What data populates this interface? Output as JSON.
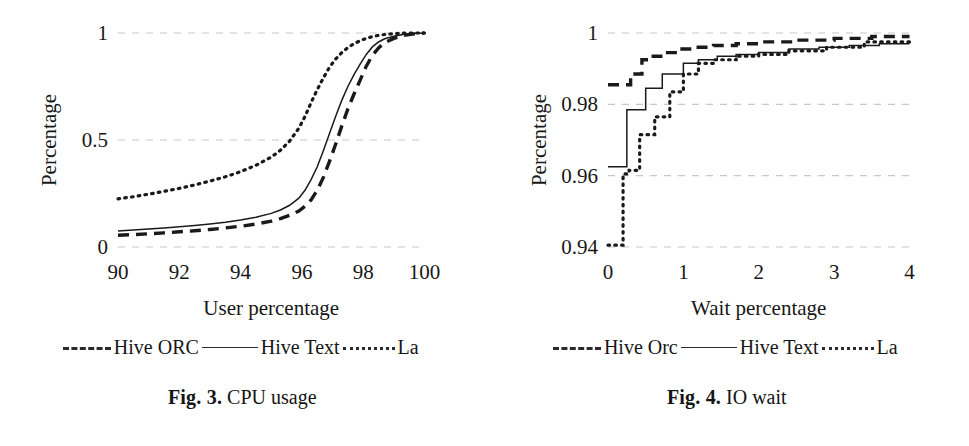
{
  "document": {
    "type": "paper-figure-pair",
    "background_color": "#ffffff",
    "ink_color": "#1a1a1a",
    "grid_color": "#c8c8c8"
  },
  "figures": [
    {
      "id": "fig3",
      "caption_number": "Fig. 3.",
      "caption_text": "CPU usage",
      "legend": [
        {
          "label": "Hive ORC",
          "style": "dashed"
        },
        {
          "label": "Hive Text",
          "style": "solid"
        },
        {
          "label": "La",
          "style": "dotted"
        }
      ],
      "chart_data": {
        "type": "line",
        "title": "",
        "subtitle": "",
        "xlabel": "User percentage",
        "ylabel": "Percentage",
        "xlim": [
          90,
          100
        ],
        "ylim": [
          0,
          1
        ],
        "xticks": [
          90,
          92,
          94,
          96,
          98,
          100
        ],
        "xticklabels": [
          "90",
          "92",
          "94",
          "96",
          "98",
          "100"
        ],
        "yticks": [
          0,
          0.5,
          1
        ],
        "yticklabels": [
          "0",
          "0.5",
          "1"
        ],
        "grid": true,
        "grid_axis": "y",
        "legend_position": "below-plot",
        "annotations": [],
        "series": [
          {
            "name": "Hive ORC",
            "style": "dashed",
            "x": [
              90.0,
              90.5,
              91.0,
              91.5,
              92.0,
              92.5,
              93.0,
              93.5,
              94.0,
              94.5,
              95.0,
              95.3,
              95.6,
              95.9,
              96.1,
              96.3,
              96.5,
              96.7,
              96.9,
              97.1,
              97.3,
              97.5,
              97.7,
              97.9,
              98.1,
              98.3,
              98.5,
              98.7,
              99.0,
              99.3,
              99.6,
              100.0
            ],
            "y": [
              0.055,
              0.058,
              0.062,
              0.066,
              0.071,
              0.076,
              0.082,
              0.089,
              0.097,
              0.107,
              0.121,
              0.133,
              0.148,
              0.168,
              0.19,
              0.22,
              0.265,
              0.325,
              0.4,
              0.48,
              0.565,
              0.645,
              0.715,
              0.78,
              0.845,
              0.895,
              0.93,
              0.955,
              0.975,
              0.988,
              0.995,
              1.0
            ]
          },
          {
            "name": "Hive Text",
            "style": "solid",
            "x": [
              90.0,
              90.5,
              91.0,
              91.5,
              92.0,
              92.5,
              93.0,
              93.5,
              94.0,
              94.5,
              95.0,
              95.3,
              95.6,
              95.9,
              96.1,
              96.3,
              96.5,
              96.7,
              96.9,
              97.1,
              97.3,
              97.5,
              97.7,
              97.9,
              98.1,
              98.3,
              98.5,
              98.7,
              99.0,
              99.3,
              99.6,
              100.0
            ],
            "y": [
              0.075,
              0.079,
              0.084,
              0.089,
              0.095,
              0.101,
              0.108,
              0.116,
              0.126,
              0.139,
              0.157,
              0.173,
              0.195,
              0.228,
              0.265,
              0.315,
              0.375,
              0.45,
              0.53,
              0.61,
              0.685,
              0.75,
              0.805,
              0.855,
              0.9,
              0.935,
              0.958,
              0.973,
              0.985,
              0.993,
              0.998,
              1.0
            ]
          },
          {
            "name": "La",
            "style": "dotted",
            "x": [
              90.0,
              90.5,
              91.0,
              91.5,
              92.0,
              92.5,
              93.0,
              93.5,
              94.0,
              94.5,
              95.0,
              95.3,
              95.6,
              95.9,
              96.1,
              96.3,
              96.5,
              96.7,
              96.9,
              97.1,
              97.3,
              97.5,
              97.7,
              97.9,
              98.1,
              98.3,
              98.5,
              98.7,
              99.0,
              99.3,
              99.6,
              100.0
            ],
            "y": [
              0.225,
              0.235,
              0.247,
              0.26,
              0.274,
              0.29,
              0.308,
              0.328,
              0.352,
              0.382,
              0.42,
              0.452,
              0.495,
              0.555,
              0.61,
              0.675,
              0.735,
              0.79,
              0.84,
              0.878,
              0.908,
              0.932,
              0.95,
              0.964,
              0.975,
              0.983,
              0.989,
              0.993,
              0.997,
              0.999,
              1.0,
              1.0
            ]
          }
        ]
      }
    },
    {
      "id": "fig4",
      "caption_number": "Fig. 4.",
      "caption_text": "IO wait",
      "legend": [
        {
          "label": "Hive Orc",
          "style": "dashed"
        },
        {
          "label": "Hive Text",
          "style": "solid"
        },
        {
          "label": "La",
          "style": "dotted"
        }
      ],
      "chart_data": {
        "type": "line",
        "title": "",
        "subtitle": "",
        "xlabel": "Wait percentage",
        "ylabel": "Percentage",
        "xlim": [
          0,
          4
        ],
        "ylim": [
          0.94,
          1
        ],
        "xticks": [
          0,
          1,
          2,
          3,
          4
        ],
        "xticklabels": [
          "0",
          "1",
          "2",
          "3",
          "4"
        ],
        "yticks": [
          0.94,
          0.96,
          0.98,
          1
        ],
        "yticklabels": [
          "0.94",
          "0.96",
          "0.98",
          "1"
        ],
        "grid": true,
        "grid_axis": "y",
        "legend_position": "below-plot",
        "annotations": [],
        "series": [
          {
            "name": "Hive Orc",
            "style": "dashed",
            "x": [
              0.0,
              0.2,
              0.2,
              0.3,
              0.3,
              0.45,
              0.45,
              0.6,
              0.6,
              0.75,
              0.75,
              0.95,
              0.95,
              1.15,
              1.15,
              1.4,
              1.4,
              1.7,
              1.7,
              2.0,
              2.0,
              2.5,
              2.5,
              3.0,
              3.0,
              3.5,
              3.5,
              4.0
            ],
            "y": [
              0.9855,
              0.9855,
              0.9855,
              0.9855,
              0.9885,
              0.9885,
              0.9925,
              0.9925,
              0.9935,
              0.9935,
              0.9945,
              0.9945,
              0.9955,
              0.9955,
              0.996,
              0.996,
              0.9965,
              0.9965,
              0.997,
              0.997,
              0.9975,
              0.9975,
              0.998,
              0.998,
              0.9985,
              0.9985,
              0.999,
              0.999
            ]
          },
          {
            "name": "Hive Text",
            "style": "solid",
            "x": [
              0.0,
              0.25,
              0.25,
              0.5,
              0.5,
              0.72,
              0.72,
              1.0,
              1.0,
              1.2,
              1.2,
              1.45,
              1.45,
              1.7,
              1.7,
              2.0,
              2.0,
              2.4,
              2.4,
              2.8,
              2.8,
              3.2,
              3.2,
              3.6,
              3.6,
              4.0
            ],
            "y": [
              0.9625,
              0.9625,
              0.9785,
              0.9785,
              0.9845,
              0.9845,
              0.9885,
              0.9885,
              0.9915,
              0.9915,
              0.9925,
              0.9925,
              0.9935,
              0.9935,
              0.994,
              0.994,
              0.9945,
              0.9945,
              0.9955,
              0.9955,
              0.996,
              0.996,
              0.9965,
              0.9965,
              0.997,
              0.997
            ]
          },
          {
            "name": "La",
            "style": "dotted",
            "x": [
              0.0,
              0.2,
              0.2,
              0.28,
              0.28,
              0.42,
              0.42,
              0.62,
              0.62,
              0.82,
              0.82,
              1.0,
              1.0,
              1.2,
              1.2,
              1.4,
              1.4,
              1.7,
              1.7,
              2.0,
              2.0,
              2.4,
              2.4,
              2.9,
              2.9,
              3.4,
              3.4,
              4.0
            ],
            "y": [
              0.9405,
              0.9405,
              0.9605,
              0.9605,
              0.9615,
              0.9615,
              0.9715,
              0.9715,
              0.9765,
              0.9765,
              0.9835,
              0.9835,
              0.9885,
              0.9885,
              0.9915,
              0.9915,
              0.9925,
              0.9925,
              0.9935,
              0.9935,
              0.994,
              0.994,
              0.995,
              0.995,
              0.996,
              0.996,
              0.9975,
              0.9975
            ]
          }
        ]
      }
    }
  ]
}
